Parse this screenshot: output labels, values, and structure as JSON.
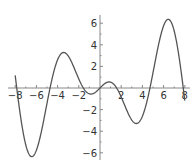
{
  "chart_data": {
    "type": "line",
    "title": "",
    "xlabel": "",
    "ylabel": "",
    "function": "x*cos(x)",
    "xlim": [
      -8,
      8
    ],
    "ylim": [
      -6.5,
      6.5
    ],
    "grid": false,
    "legend": null,
    "x_ticks": [
      -8,
      -6,
      -4,
      -2,
      2,
      4,
      6,
      8
    ],
    "x_tick_labels": [
      "-8",
      "-6",
      "-4",
      "-2",
      "2",
      "4",
      "6",
      "8"
    ],
    "y_ticks": [
      -6,
      -4,
      -2,
      2,
      4,
      6
    ],
    "y_tick_labels": [
      "-6",
      "-4",
      "-2",
      "2",
      "4",
      "6"
    ],
    "series": [
      {
        "name": "x cos x",
        "x": [
          -8,
          -7.5,
          -7,
          -6.6,
          -6,
          -5.5,
          -5,
          -4.71,
          -4,
          -3.43,
          -3,
          -2.5,
          -2,
          -1.57,
          -1,
          -0.86,
          -0.5,
          0,
          0.5,
          0.86,
          1,
          1.57,
          2,
          2.5,
          3,
          3.43,
          4,
          4.71,
          5,
          5.5,
          6,
          6.6,
          7,
          7.5,
          8
        ],
        "values": [
          1.16,
          -2.6,
          -5.28,
          -6.27,
          -5.76,
          -3.89,
          -1.42,
          0,
          2.61,
          3.29,
          2.97,
          2.0,
          0.83,
          0,
          -0.54,
          -0.56,
          -0.44,
          0,
          0.44,
          0.56,
          0.54,
          0,
          -0.83,
          -2.0,
          -2.97,
          -3.29,
          -2.61,
          0,
          1.42,
          3.89,
          5.76,
          6.27,
          5.28,
          2.6,
          -1.16
        ]
      }
    ],
    "colors": {
      "curve": "#555555",
      "axes": "#888888",
      "labels": "#333333"
    }
  }
}
